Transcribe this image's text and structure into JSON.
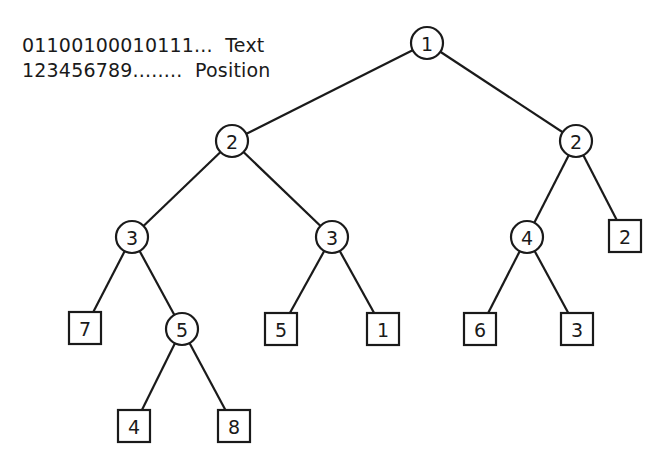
{
  "legend": {
    "rows": [
      {
        "sequence": "01100100010111...",
        "label": "Text"
      },
      {
        "sequence": "123456789........",
        "label": "Position"
      }
    ]
  },
  "tree": {
    "nodes": [
      {
        "id": "n1",
        "type": "internal",
        "label": "1",
        "x": 427,
        "y": 43
      },
      {
        "id": "n2l",
        "type": "internal",
        "label": "2",
        "x": 232,
        "y": 141
      },
      {
        "id": "n2r",
        "type": "internal",
        "label": "2",
        "x": 576,
        "y": 141
      },
      {
        "id": "n3l",
        "type": "internal",
        "label": "3",
        "x": 132,
        "y": 237
      },
      {
        "id": "n3m",
        "type": "internal",
        "label": "3",
        "x": 332,
        "y": 237
      },
      {
        "id": "n4",
        "type": "internal",
        "label": "4",
        "x": 527,
        "y": 237
      },
      {
        "id": "leaf2",
        "type": "leaf",
        "label": "2",
        "x": 625,
        "y": 236
      },
      {
        "id": "leaf7",
        "type": "leaf",
        "label": "7",
        "x": 85,
        "y": 328
      },
      {
        "id": "n5",
        "type": "internal",
        "label": "5",
        "x": 182,
        "y": 329
      },
      {
        "id": "leaf5",
        "type": "leaf",
        "label": "5",
        "x": 281,
        "y": 329
      },
      {
        "id": "leaf1",
        "type": "leaf",
        "label": "1",
        "x": 383,
        "y": 329
      },
      {
        "id": "leaf6",
        "type": "leaf",
        "label": "6",
        "x": 480,
        "y": 329
      },
      {
        "id": "leaf3",
        "type": "leaf",
        "label": "3",
        "x": 577,
        "y": 329
      },
      {
        "id": "leaf4",
        "type": "leaf",
        "label": "4",
        "x": 134,
        "y": 426
      },
      {
        "id": "leaf8",
        "type": "leaf",
        "label": "8",
        "x": 234,
        "y": 426
      }
    ],
    "edges": [
      [
        "n1",
        "n2l"
      ],
      [
        "n1",
        "n2r"
      ],
      [
        "n2l",
        "n3l"
      ],
      [
        "n2l",
        "n3m"
      ],
      [
        "n2r",
        "n4"
      ],
      [
        "n2r",
        "leaf2"
      ],
      [
        "n3l",
        "leaf7"
      ],
      [
        "n3l",
        "n5"
      ],
      [
        "n3m",
        "leaf5"
      ],
      [
        "n3m",
        "leaf1"
      ],
      [
        "n4",
        "leaf6"
      ],
      [
        "n4",
        "leaf3"
      ],
      [
        "n5",
        "leaf4"
      ],
      [
        "n5",
        "leaf8"
      ]
    ],
    "circle_radius": 16,
    "square_size": 32
  },
  "colors": {
    "stroke": "#1a1a1a",
    "background": "#ffffff"
  }
}
